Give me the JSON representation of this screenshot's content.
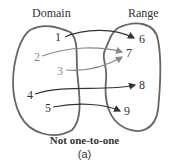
{
  "labels": {
    "domain": "Domain",
    "range": "Range"
  },
  "domain_values": [
    "1",
    "2",
    "3",
    "4",
    "5"
  ],
  "range_values": [
    "6",
    "7",
    "8",
    "9"
  ],
  "mappings": [
    {
      "from": "1",
      "to": "6"
    },
    {
      "from": "2",
      "to": "7"
    },
    {
      "from": "3",
      "to": "7"
    },
    {
      "from": "4",
      "to": "8"
    },
    {
      "from": "5",
      "to": "9"
    }
  ],
  "caption": "Not one-to-one",
  "sublabel": "(a)",
  "colors": {
    "outline": "#666666",
    "arrow_dark": "#333333",
    "arrow_light": "#888888"
  }
}
